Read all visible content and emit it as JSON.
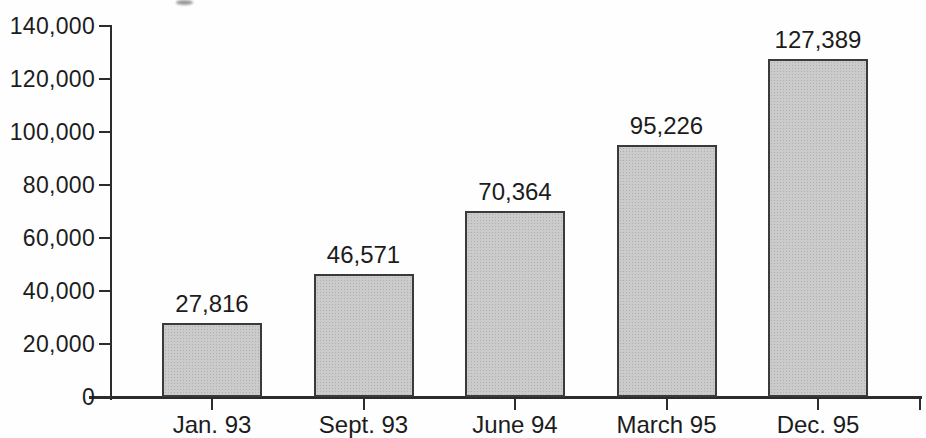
{
  "chart_data": {
    "type": "bar",
    "title": "",
    "xlabel": "",
    "ylabel": "",
    "categories": [
      "Jan. 93",
      "Sept. 93",
      "June 94",
      "March 95",
      "Dec. 95"
    ],
    "values": [
      27816,
      46571,
      70364,
      95226,
      127389
    ],
    "value_labels": [
      "27,816",
      "46,571",
      "70,364",
      "95,226",
      "127,389"
    ],
    "ylim": [
      0,
      140000
    ],
    "ytick_interval": 20000,
    "ytick_labels": [
      "0",
      "20,000",
      "40,000",
      "60,000",
      "80,000",
      "100,000",
      "120,000",
      "140,000"
    ],
    "grid": false,
    "legend": null,
    "bar_texture": "halftone-dots"
  },
  "colors": {
    "axis": "#2c2c2c",
    "text": "#1c1c1c",
    "background": "#fefefe",
    "bar_fill": "#cbcbcb",
    "bar_dot": "#aeaeae",
    "bar_border": "#3a3a3a"
  }
}
